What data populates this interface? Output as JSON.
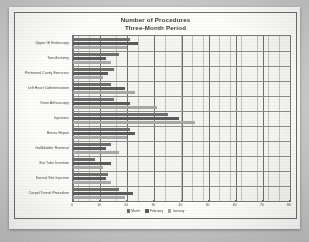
{
  "chart_data": {
    "type": "bar",
    "orientation": "horizontal",
    "title": "Number of Procedures",
    "subtitle": "Three-Month Period",
    "xlabel": "",
    "ylabel": "",
    "xlim": [
      0,
      80
    ],
    "xticks": [
      "0",
      "10",
      "20",
      "30",
      "40",
      "50",
      "60",
      "70",
      "80"
    ],
    "grid": true,
    "legend_position": "bottom",
    "categories": [
      "Upper GI Endoscopy",
      "Tonsillectomy",
      "Peritoneal Cavity Exercises",
      "Left Heart Catheterization",
      "Knee Arthroscopy",
      "Injections",
      "Hernia Repair",
      "Gallbladder Removal",
      "Ear Tube Insertion",
      "Dermal Site Injection",
      "Carpal Tunnel Procedure"
    ],
    "series": [
      {
        "name": "March",
        "color": "#6f6f6f",
        "values": [
          21,
          17,
          15,
          14,
          15,
          35,
          21,
          14,
          8,
          13,
          17
        ]
      },
      {
        "name": "February",
        "color": "#5b5b5b",
        "values": [
          24,
          12,
          13,
          19,
          21,
          39,
          23,
          12,
          14,
          12,
          22
        ]
      },
      {
        "name": "January",
        "color": "#a8a8a8",
        "values": [
          20,
          14,
          11,
          23,
          31,
          45,
          20,
          17,
          11,
          14,
          19
        ]
      }
    ]
  },
  "legend": {
    "items": [
      {
        "label": "March"
      },
      {
        "label": "February"
      },
      {
        "label": "January"
      }
    ]
  }
}
